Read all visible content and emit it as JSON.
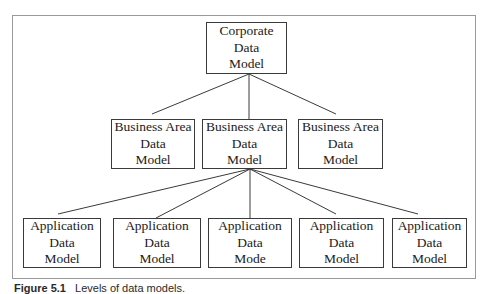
{
  "diagram": {
    "type": "hierarchy",
    "levels": [
      {
        "name": "corporate",
        "nodes": [
          {
            "id": "corporate",
            "lines": [
              "Corporate",
              "Data",
              "Model"
            ]
          }
        ]
      },
      {
        "name": "business-area",
        "nodes": [
          {
            "id": "ba1",
            "lines": [
              "Business Area",
              "Data",
              "Model"
            ]
          },
          {
            "id": "ba2",
            "lines": [
              "Business Area",
              "Data",
              "Model"
            ]
          },
          {
            "id": "ba3",
            "lines": [
              "Business Area",
              "Data",
              "Model"
            ]
          }
        ]
      },
      {
        "name": "application",
        "nodes": [
          {
            "id": "app1",
            "lines": [
              "Application",
              "Data",
              "Model"
            ]
          },
          {
            "id": "app2",
            "lines": [
              "Application",
              "Data",
              "Model"
            ]
          },
          {
            "id": "app3",
            "lines": [
              "Application",
              "Data",
              "Mode"
            ]
          },
          {
            "id": "app4",
            "lines": [
              "Application",
              "Data",
              "Model"
            ]
          },
          {
            "id": "app5",
            "lines": [
              "Application",
              "Data",
              "Model"
            ]
          }
        ]
      }
    ],
    "edges": [
      [
        "corporate",
        "ba1"
      ],
      [
        "corporate",
        "ba2"
      ],
      [
        "corporate",
        "ba3"
      ],
      [
        "ba2",
        "app1"
      ],
      [
        "ba2",
        "app2"
      ],
      [
        "ba2",
        "app3"
      ],
      [
        "ba2",
        "app4"
      ],
      [
        "ba2",
        "app5"
      ]
    ]
  },
  "caption": {
    "figure_label": "Figure 5.1",
    "text": "Levels of data models."
  }
}
